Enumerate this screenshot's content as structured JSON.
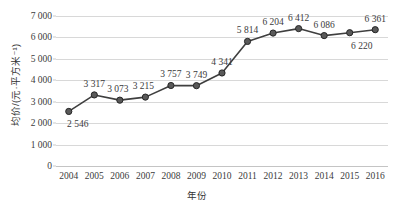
{
  "chart_data": {
    "type": "line",
    "title": "",
    "xlabel": "年份",
    "ylabel": "均价/(元·平方米⁻¹)",
    "categories": [
      "2004",
      "2005",
      "2006",
      "2007",
      "2008",
      "2009",
      "2010",
      "2011",
      "2012",
      "2013",
      "2014",
      "2015",
      "2016"
    ],
    "values": [
      2546,
      3317,
      3073,
      3215,
      3757,
      3749,
      4341,
      5814,
      6204,
      6412,
      6086,
      6220,
      6361
    ],
    "point_labels": [
      "2 546",
      "3 317",
      "3 073",
      "3 215",
      "3 757",
      "3 749",
      "4 341",
      "5 814",
      "6 204",
      "6 412",
      "6 086",
      "6 220",
      "6 361"
    ],
    "label_positions": [
      "below",
      "above",
      "above",
      "above",
      "above",
      "above",
      "above",
      "above",
      "above",
      "above",
      "above",
      "below",
      "above"
    ],
    "ylim": [
      0,
      7000
    ],
    "y_ticks": [
      0,
      1000,
      2000,
      3000,
      4000,
      5000,
      6000,
      7000
    ],
    "y_tick_labels": [
      "0",
      "1 000",
      "2 000",
      "3 000",
      "4 000",
      "5 000",
      "6 000",
      "7 000"
    ],
    "grid": true,
    "legend": "none",
    "series_color": "#3f3f3f",
    "marker_color": "#595959",
    "marker_edge_color": "#262626",
    "gridline_color": "#d8d8d8"
  }
}
